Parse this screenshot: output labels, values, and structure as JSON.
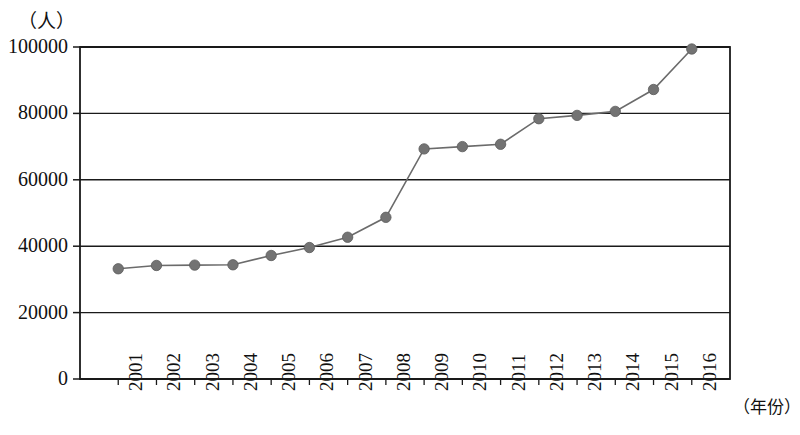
{
  "chart_data": {
    "type": "line",
    "title": "",
    "subtitle": "",
    "xlabel": "（年份）",
    "ylabel": "（人）",
    "ylim": [
      0,
      100000
    ],
    "yticks": [
      0,
      20000,
      40000,
      60000,
      80000,
      100000
    ],
    "ytick_labels": [
      "0",
      "20000",
      "40000",
      "60000",
      "80000",
      "100000"
    ],
    "grid": true,
    "legend": null,
    "categories": [
      "2001",
      "2002",
      "2003",
      "2004",
      "2005",
      "2006",
      "2007",
      "2008",
      "2009",
      "2010",
      "2011",
      "2012",
      "2013",
      "2014",
      "2015",
      "2016"
    ],
    "x": [
      2001,
      2002,
      2003,
      2004,
      2005,
      2006,
      2007,
      2008,
      2009,
      2010,
      2011,
      2012,
      2013,
      2014,
      2015,
      2016
    ],
    "values": [
      33200,
      34200,
      34300,
      34400,
      37200,
      39600,
      42700,
      48700,
      69300,
      70000,
      70700,
      78400,
      79400,
      80600,
      87200,
      99400
    ],
    "series": [
      {
        "name": "人数",
        "values": [
          33200,
          34200,
          34300,
          34400,
          37200,
          39600,
          42700,
          48700,
          69300,
          70000,
          70700,
          78400,
          79400,
          80600,
          87200,
          99400
        ],
        "color": "#6b6b6b",
        "marker": "circle",
        "marker_color": "#737373"
      }
    ],
    "axis_color": "#1a1a1a",
    "gridline_color": "#1a1a1a",
    "background_color": "#ffffff"
  },
  "axis_unit": {
    "y_unit_text": "（人）",
    "x_unit_text": "（年份）"
  }
}
